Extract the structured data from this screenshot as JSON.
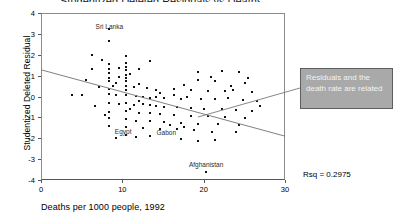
{
  "figure": {
    "clipped_title": "Studentized Deleted Residuals vs Deaths per 1000",
    "rsq_label": "Rsq = 0.2975"
  },
  "callout": {
    "text": "Residuals and the death rate are related",
    "fill_color": "#a9a9a9",
    "border_color": "#5e5e5e",
    "text_color": "#f2f2f2"
  },
  "chart_data": {
    "type": "scatter",
    "title": "",
    "xlabel": "Deaths per 1000 people, 1992",
    "ylabel": "Studentized Deleted Residual",
    "xlim": [
      0,
      30
    ],
    "ylim": [
      -4,
      4
    ],
    "xticks": [
      0,
      10,
      20,
      30
    ],
    "yticks": [
      -4,
      -3,
      -2,
      -1,
      0,
      1,
      2,
      3,
      4
    ],
    "grid": false,
    "legend": null,
    "point_color": "#111111",
    "fit_line": {
      "name": "least-squares fit",
      "x": [
        0,
        30
      ],
      "y": [
        1.28,
        -1.9
      ],
      "slope": -0.106,
      "intercept": 1.28,
      "color": "#808080"
    },
    "annotations": [
      {
        "text": "Sri Lanka",
        "x": 8.4,
        "y": 3.35
      },
      {
        "text": "Egypt",
        "x": 10.1,
        "y": -1.72
      },
      {
        "text": "Gabon",
        "x": 15.4,
        "y": -1.74
      },
      {
        "text": "Afghanistan",
        "x": 20.3,
        "y": -3.3
      },
      {
        "text": "Rsq = 0.2975",
        "x": 31.5,
        "y": -3.6
      }
    ],
    "points": [
      [
        8.4,
        3.22
      ],
      [
        8.4,
        2.68
      ],
      [
        6.3,
        2.0
      ],
      [
        10.5,
        1.92
      ],
      [
        13.4,
        1.68
      ],
      [
        8.4,
        1.55
      ],
      [
        10.5,
        1.6
      ],
      [
        10.5,
        1.42
      ],
      [
        6.3,
        1.3
      ],
      [
        8.4,
        1.3
      ],
      [
        10.5,
        1.28
      ],
      [
        22.3,
        1.22
      ],
      [
        24.4,
        1.18
      ],
      [
        19.3,
        1.15
      ],
      [
        8.4,
        1.12
      ],
      [
        10.5,
        1.05
      ],
      [
        5.5,
        0.78
      ],
      [
        8.4,
        0.9
      ],
      [
        8.4,
        0.72
      ],
      [
        10.5,
        0.9
      ],
      [
        10.5,
        0.72
      ],
      [
        12.1,
        0.62
      ],
      [
        19.3,
        0.78
      ],
      [
        21.4,
        0.72
      ],
      [
        25.1,
        0.65
      ],
      [
        23.3,
        0.52
      ],
      [
        8.8,
        0.52
      ],
      [
        10.5,
        0.5
      ],
      [
        11.4,
        0.45
      ],
      [
        13.0,
        0.42
      ],
      [
        8.4,
        0.35
      ],
      [
        10.5,
        0.32
      ],
      [
        14.2,
        0.3
      ],
      [
        16.3,
        0.35
      ],
      [
        18.4,
        0.3
      ],
      [
        20.5,
        0.28
      ],
      [
        22.6,
        0.25
      ],
      [
        26.0,
        0.22
      ],
      [
        3.8,
        0.05
      ],
      [
        5.0,
        0.05
      ],
      [
        8.4,
        0.1
      ],
      [
        9.2,
        0.05
      ],
      [
        10.5,
        0.08
      ],
      [
        11.7,
        0.02
      ],
      [
        12.6,
        0.0
      ],
      [
        13.4,
        -0.05
      ],
      [
        14.2,
        -0.02
      ],
      [
        15.1,
        -0.08
      ],
      [
        16.3,
        0.05
      ],
      [
        17.2,
        -0.1
      ],
      [
        18.0,
        0.0
      ],
      [
        19.7,
        -0.12
      ],
      [
        21.4,
        -0.1
      ],
      [
        23.0,
        -0.05
      ],
      [
        24.8,
        -0.15
      ],
      [
        26.5,
        -0.2
      ],
      [
        8.4,
        -0.3
      ],
      [
        9.6,
        -0.35
      ],
      [
        10.5,
        -0.32
      ],
      [
        11.4,
        -0.4
      ],
      [
        12.6,
        -0.38
      ],
      [
        13.4,
        -0.42
      ],
      [
        14.2,
        -0.45
      ],
      [
        15.1,
        -0.5
      ],
      [
        16.7,
        -0.48
      ],
      [
        18.4,
        -0.55
      ],
      [
        20.1,
        -0.6
      ],
      [
        22.3,
        -0.58
      ],
      [
        24.0,
        -0.65
      ],
      [
        26.0,
        -0.7
      ],
      [
        8.4,
        -0.72
      ],
      [
        10.5,
        -0.7
      ],
      [
        12.1,
        -0.78
      ],
      [
        13.4,
        -0.8
      ],
      [
        14.6,
        -0.85
      ],
      [
        16.3,
        -0.88
      ],
      [
        18.4,
        -0.92
      ],
      [
        20.5,
        -0.95
      ],
      [
        22.6,
        -1.0
      ],
      [
        25.1,
        -1.05
      ],
      [
        8.4,
        -1.05
      ],
      [
        10.5,
        -1.1
      ],
      [
        11.7,
        -1.15
      ],
      [
        13.4,
        -1.18
      ],
      [
        15.1,
        -1.2
      ],
      [
        17.2,
        -1.25
      ],
      [
        19.3,
        -1.3
      ],
      [
        21.8,
        -1.32
      ],
      [
        24.4,
        -1.38
      ],
      [
        8.4,
        -1.42
      ],
      [
        10.5,
        -1.45
      ],
      [
        12.6,
        -1.5
      ],
      [
        14.6,
        -1.55
      ],
      [
        16.7,
        -1.58
      ],
      [
        18.8,
        -1.62
      ],
      [
        21.0,
        -1.68
      ],
      [
        24.0,
        -1.72
      ],
      [
        10.5,
        -1.85
      ],
      [
        13.4,
        -1.9
      ],
      [
        17.2,
        -2.05
      ],
      [
        19.3,
        -2.15
      ],
      [
        21.4,
        -2.1
      ],
      [
        9.2,
        -2.0
      ],
      [
        11.7,
        -1.95
      ],
      [
        20.3,
        -3.62
      ],
      [
        7.5,
        1.75
      ],
      [
        9.6,
        1.35
      ],
      [
        9.6,
        0.95
      ],
      [
        11.0,
        1.1
      ],
      [
        20.9,
        0.95
      ],
      [
        25.5,
        0.9
      ],
      [
        12.1,
        1.3
      ],
      [
        6.7,
        -0.45
      ],
      [
        7.1,
        0.45
      ],
      [
        7.9,
        -0.9
      ],
      [
        9.2,
        0.65
      ],
      [
        11.0,
        -0.6
      ],
      [
        12.1,
        -0.2
      ],
      [
        14.6,
        0.15
      ],
      [
        17.6,
        0.55
      ],
      [
        23.6,
        0.32
      ],
      [
        26.9,
        -0.45
      ],
      [
        15.9,
        -1.35
      ],
      [
        17.6,
        -1.48
      ]
    ]
  }
}
